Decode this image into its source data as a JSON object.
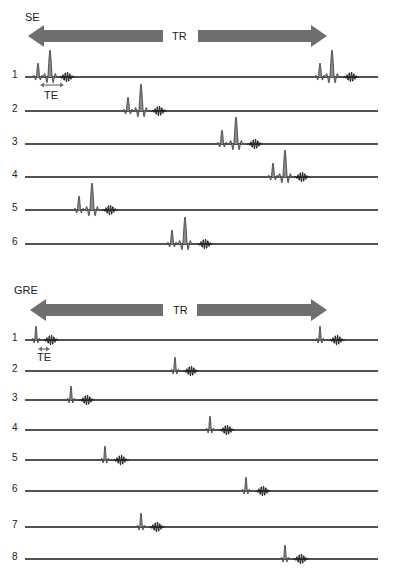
{
  "colors": {
    "arrow": "#6f6f6f",
    "pulse_fill": "#8a8a8a",
    "line": "#1a1a1a",
    "text": "#222222"
  },
  "se": {
    "title": "SE",
    "tr_label": "TR",
    "te_label": "TE",
    "arrow": {
      "y": 36,
      "left_tip": 28,
      "left_shaft_end": 163,
      "right_shaft_start": 198,
      "right_tip": 327
    },
    "te_arrow": {
      "y": 85,
      "x1": 40,
      "x2": 64
    },
    "line": {
      "x1": 25,
      "x2": 378
    },
    "rows": [
      {
        "label": "1",
        "y": 77,
        "excitations": [
          {
            "p90": 38,
            "p180": 50,
            "echo": 67
          },
          {
            "p90": 320,
            "p180": 332,
            "echo": 351
          }
        ]
      },
      {
        "label": "2",
        "y": 111,
        "excitations": [
          {
            "p90": 128,
            "p180": 141,
            "echo": 159
          }
        ]
      },
      {
        "label": "3",
        "y": 144,
        "excitations": [
          {
            "p90": 222,
            "p180": 236,
            "echo": 255
          }
        ]
      },
      {
        "label": "4",
        "y": 177,
        "excitations": [
          {
            "p90": 273,
            "p180": 285,
            "echo": 302
          }
        ]
      },
      {
        "label": "5",
        "y": 210,
        "excitations": [
          {
            "p90": 79,
            "p180": 92,
            "echo": 110
          }
        ]
      },
      {
        "label": "6",
        "y": 244,
        "excitations": [
          {
            "p90": 172,
            "p180": 185,
            "echo": 205
          }
        ]
      }
    ]
  },
  "gre": {
    "title": "GRE",
    "tr_label": "TR",
    "te_label": "TE",
    "arrow": {
      "y": 310,
      "left_tip": 30,
      "left_shaft_end": 163,
      "right_shaft_start": 197,
      "right_tip": 327
    },
    "te_arrow": {
      "y": 349,
      "x1": 38,
      "x2": 50
    },
    "line": {
      "x1": 25,
      "x2": 378
    },
    "rows": [
      {
        "label": "1",
        "y": 340,
        "excitations": [
          {
            "pulse": 36,
            "echo": 51
          },
          {
            "pulse": 320,
            "echo": 337
          }
        ]
      },
      {
        "label": "2",
        "y": 371,
        "excitations": [
          {
            "pulse": 175,
            "echo": 191
          }
        ]
      },
      {
        "label": "3",
        "y": 400,
        "excitations": [
          {
            "pulse": 71,
            "echo": 87
          }
        ]
      },
      {
        "label": "4",
        "y": 430,
        "excitations": [
          {
            "pulse": 210,
            "echo": 227
          }
        ]
      },
      {
        "label": "5",
        "y": 460,
        "excitations": [
          {
            "pulse": 105,
            "echo": 121
          }
        ]
      },
      {
        "label": "6",
        "y": 491,
        "excitations": [
          {
            "pulse": 246,
            "echo": 263
          }
        ]
      },
      {
        "label": "7",
        "y": 527,
        "excitations": [
          {
            "pulse": 141,
            "echo": 157
          }
        ]
      },
      {
        "label": "8",
        "y": 559,
        "excitations": [
          {
            "pulse": 285,
            "echo": 301
          }
        ]
      }
    ]
  }
}
